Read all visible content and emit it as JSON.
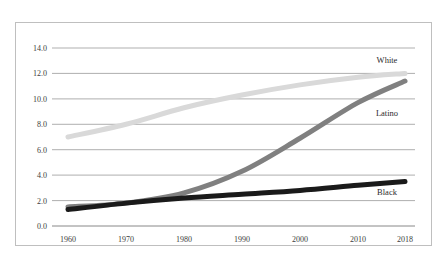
{
  "chart_data": {
    "type": "line",
    "title": "",
    "subtitle": "",
    "xlabel": "",
    "ylabel": "",
    "x": [
      1960,
      1970,
      1980,
      1990,
      2000,
      2010,
      2018
    ],
    "xticklabels": [
      "1960",
      "1970",
      "1980",
      "1990",
      "2000",
      "2010",
      "2018"
    ],
    "yticks": [
      0.0,
      2.0,
      4.0,
      6.0,
      8.0,
      10.0,
      12.0,
      14.0
    ],
    "yticklabels": [
      "0.0",
      "2.0",
      "4.0",
      "6.0",
      "8.0",
      "10.0",
      "12.0",
      "14.0"
    ],
    "ylim": [
      0.0,
      14.0
    ],
    "xlim": [
      1960,
      2018
    ],
    "grid": "horizontal",
    "legend": "inline-end-labels",
    "series": [
      {
        "name": "White",
        "color": "#d9d9d9",
        "label_text": "White",
        "values": [
          7.0,
          8.0,
          9.3,
          10.3,
          11.1,
          11.7,
          12.0
        ]
      },
      {
        "name": "Latino",
        "color": "#808080",
        "label_text": "Latino",
        "values": [
          1.5,
          1.8,
          2.6,
          4.3,
          6.9,
          9.7,
          11.4
        ]
      },
      {
        "name": "Black",
        "color": "#1a1a1a",
        "label_text": "Black",
        "values": [
          1.3,
          1.8,
          2.2,
          2.5,
          2.8,
          3.2,
          3.5
        ]
      }
    ]
  },
  "labels": {
    "white": "White",
    "latino": "Latino",
    "black": "Black",
    "y0": "0.0",
    "y2": "2.0",
    "y4": "4.0",
    "y6": "6.0",
    "y8": "8.0",
    "y10": "10.0",
    "y12": "12.0",
    "y14": "14.0",
    "x1960": "1960",
    "x1970": "1970",
    "x1980": "1980",
    "x1990": "1990",
    "x2000": "2000",
    "x2010": "2010",
    "x2018": "2018"
  }
}
